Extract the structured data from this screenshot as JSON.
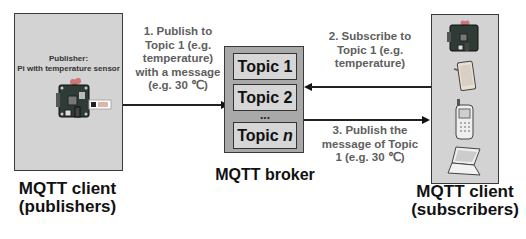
{
  "publisher_panel": {
    "title_line1": "Publisher:",
    "title_line2": "Pi with temperature sensor",
    "device_icon": "raspberry-pi-with-sensor-icon",
    "label_line1": "MQTT client",
    "label_line2": "(publishers)"
  },
  "broker": {
    "topics": [
      "Topic 1",
      "Topic 2"
    ],
    "ellipsis": "...",
    "last_topic_prefix": "Topic ",
    "last_topic_var": "n",
    "label": "MQTT broker"
  },
  "subscriber_panel": {
    "devices": [
      "raspberry-pi-icon",
      "tablet-icon",
      "mobile-phone-icon",
      "laptop-icon"
    ],
    "label_line1": "MQTT client",
    "label_line2": "(subscribers)"
  },
  "arrows": {
    "publish": {
      "direction": "right",
      "lines": [
        "1. Publish to",
        "Topic 1 (e.g.",
        "temperature)",
        "with a message",
        "(e.g. 30 ℃)"
      ]
    },
    "subscribe": {
      "direction": "left",
      "lines": [
        "2. Subscribe to",
        "Topic 1 (e.g.",
        "temperature)"
      ]
    },
    "deliver": {
      "direction": "right",
      "lines": [
        "3. Publish the",
        "message of Topic",
        "1 (e.g. 30 ℃)"
      ]
    }
  },
  "colors": {
    "panel_fill": "#d3d3d3",
    "annotation_text": "#5e5e5e",
    "label_text": "#111111"
  }
}
